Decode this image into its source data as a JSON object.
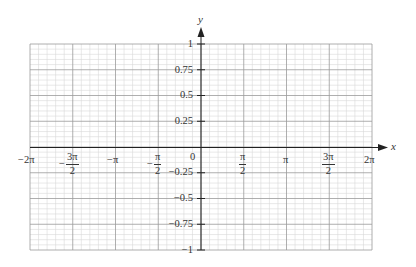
{
  "chart_data": {
    "type": "line",
    "title": "",
    "xlabel": "x",
    "ylabel": "y",
    "xlim": [
      -6.283185,
      6.283185
    ],
    "ylim": [
      -1,
      1
    ],
    "grid": true,
    "grid_major": {
      "x_step": "π/2",
      "y_step": 0.25
    },
    "grid_minor_divisions": {
      "x": 5,
      "y": 5
    },
    "series": [],
    "x_tick_labels": [
      "−2π",
      "−3π/2",
      "−π",
      "−π/2",
      "0",
      "π/2",
      "π",
      "3π/2",
      "2π"
    ],
    "x_tick_values": [
      -6.283185,
      -4.712389,
      -3.141593,
      -1.570796,
      0,
      1.570796,
      3.141593,
      4.712389,
      6.283185
    ],
    "y_tick_labels": [
      "1",
      "0.75",
      "0.5",
      "0.25",
      "−0.25",
      "−0.5",
      "−0.75",
      "−1"
    ],
    "y_tick_values": [
      1,
      0.75,
      0.5,
      0.25,
      -0.25,
      -0.5,
      -0.75,
      -1
    ],
    "origin_label": "0",
    "legend": null
  },
  "labels": {
    "x_axis": "x",
    "y_axis": "y",
    "origin": "0",
    "x_ticks": [
      {
        "id": "neg-2pi",
        "type": "simple",
        "text": "−2π"
      },
      {
        "id": "neg-3pi-2",
        "type": "frac",
        "sign": "−",
        "num": "3π",
        "den": "2"
      },
      {
        "id": "neg-pi",
        "type": "simple",
        "text": "−π"
      },
      {
        "id": "neg-pi-2",
        "type": "frac",
        "sign": "−",
        "num": "π",
        "den": "2"
      },
      {
        "id": "pi-2",
        "type": "frac",
        "sign": "",
        "num": "π",
        "den": "2"
      },
      {
        "id": "pi",
        "type": "simple",
        "text": "π"
      },
      {
        "id": "3pi-2",
        "type": "frac",
        "sign": "",
        "num": "3π",
        "den": "2"
      },
      {
        "id": "2pi",
        "type": "simple",
        "text": "2π"
      }
    ],
    "y_ticks": [
      {
        "id": "1",
        "text": "1"
      },
      {
        "id": "0-75",
        "text": "0.75"
      },
      {
        "id": "0-5",
        "text": "0.5"
      },
      {
        "id": "0-25",
        "text": "0.25"
      },
      {
        "id": "neg-0-25",
        "text": "−0.25"
      },
      {
        "id": "neg-0-5",
        "text": "−0.5"
      },
      {
        "id": "neg-0-75",
        "text": "−0.75"
      },
      {
        "id": "neg-1",
        "text": "−1"
      }
    ]
  },
  "colors": {
    "minor_grid": "#d9d9d9",
    "major_grid": "#9a9a9a",
    "axis": "#222222",
    "text": "#333333"
  }
}
